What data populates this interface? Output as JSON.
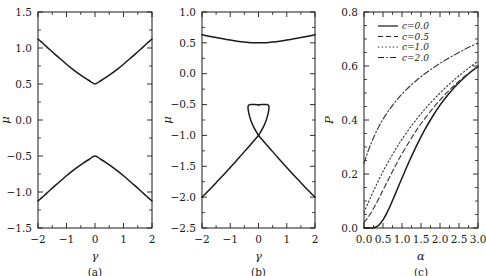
{
  "figure": {
    "width": 486,
    "height": 276,
    "background": "#ffffff",
    "line_color": "#1a1a1a"
  },
  "chart_data": [
    {
      "type": "line",
      "panel_label": "(a)",
      "title": "",
      "xlabel": "γ",
      "ylabel": "μ",
      "xlim": [
        -2,
        2
      ],
      "ylim": [
        -1.5,
        1.5
      ],
      "xticks": [
        -2,
        -1,
        0,
        1,
        2
      ],
      "xticklabels": [
        "−2",
        "−1",
        "0",
        "1",
        "2"
      ],
      "yticks": [
        -1.5,
        -1.0,
        -0.5,
        0.0,
        0.5,
        1.0,
        1.5
      ],
      "yticklabels": [
        "−1.5",
        "−1.0",
        "−0.5",
        "0.0",
        "0.5",
        "1.0",
        "1.5"
      ],
      "grid": false,
      "legend": "none",
      "series": [
        {
          "name": "upper-branch",
          "style": "solid",
          "x": [
            -2.0,
            -1.8,
            -1.6,
            -1.4,
            -1.2,
            -1.0,
            -0.8,
            -0.6,
            -0.4,
            -0.2,
            0.0,
            0.2,
            0.4,
            0.6,
            0.8,
            1.0,
            1.2,
            1.4,
            1.6,
            1.8,
            2.0
          ],
          "y": [
            1.125,
            1.055,
            0.983,
            0.912,
            0.843,
            0.775,
            0.71,
            0.65,
            0.595,
            0.545,
            0.5,
            0.545,
            0.595,
            0.65,
            0.71,
            0.775,
            0.843,
            0.912,
            0.983,
            1.055,
            1.125
          ]
        },
        {
          "name": "lower-branch",
          "style": "solid",
          "x": [
            -2.0,
            -1.8,
            -1.6,
            -1.4,
            -1.2,
            -1.0,
            -0.8,
            -0.6,
            -0.4,
            -0.2,
            0.0,
            0.2,
            0.4,
            0.6,
            0.8,
            1.0,
            1.2,
            1.4,
            1.6,
            1.8,
            2.0
          ],
          "y": [
            -1.125,
            -1.055,
            -0.983,
            -0.912,
            -0.843,
            -0.775,
            -0.71,
            -0.65,
            -0.595,
            -0.545,
            -0.5,
            -0.545,
            -0.595,
            -0.65,
            -0.71,
            -0.775,
            -0.843,
            -0.912,
            -0.983,
            -1.055,
            -1.125
          ]
        }
      ]
    },
    {
      "type": "line",
      "panel_label": "(b)",
      "title": "",
      "xlabel": "γ",
      "ylabel": "μ",
      "xlim": [
        -2,
        2
      ],
      "ylim": [
        -2.5,
        1.0
      ],
      "xticks": [
        -2,
        -1,
        0,
        1,
        2
      ],
      "xticklabels": [
        "−2",
        "−1",
        "0",
        "1",
        "2"
      ],
      "yticks": [
        -2.5,
        -2.0,
        -1.5,
        -1.0,
        -0.5,
        0.0,
        0.5,
        1.0
      ],
      "yticklabels": [
        "−2.5",
        "−2.0",
        "−1.5",
        "−1.0",
        "−0.5",
        "0.0",
        "0.5",
        "1.0"
      ],
      "grid": false,
      "legend": "none",
      "series": [
        {
          "name": "upper-branch",
          "style": "solid",
          "x": [
            -2.0,
            -1.75,
            -1.5,
            -1.25,
            -1.0,
            -0.75,
            -0.5,
            -0.25,
            0.0,
            0.25,
            0.5,
            0.75,
            1.0,
            1.25,
            1.5,
            1.75,
            2.0
          ],
          "y": [
            0.63,
            0.607,
            0.585,
            0.565,
            0.545,
            0.527,
            0.513,
            0.503,
            0.5,
            0.503,
            0.513,
            0.527,
            0.545,
            0.565,
            0.585,
            0.607,
            0.63
          ]
        },
        {
          "name": "loop-upper-left",
          "style": "solid",
          "x": [
            0.0,
            -0.08,
            -0.16,
            -0.24,
            -0.3,
            -0.345,
            -0.368,
            -0.37,
            -0.35,
            -0.3,
            -0.22,
            -0.12,
            0.0
          ],
          "y": [
            -1.0,
            -0.94,
            -0.875,
            -0.795,
            -0.715,
            -0.635,
            -0.57,
            -0.535,
            -0.512,
            -0.5,
            -0.498,
            -0.5,
            -0.505
          ]
        },
        {
          "name": "loop-upper-right",
          "style": "solid",
          "x": [
            0.0,
            0.08,
            0.16,
            0.24,
            0.3,
            0.345,
            0.368,
            0.37,
            0.35,
            0.3,
            0.22,
            0.12,
            0.0
          ],
          "y": [
            -1.0,
            -0.94,
            -0.875,
            -0.795,
            -0.715,
            -0.635,
            -0.57,
            -0.535,
            -0.512,
            -0.5,
            -0.498,
            -0.5,
            -0.505
          ]
        },
        {
          "name": "lower-arm-left",
          "style": "solid",
          "x": [
            0.0,
            -0.2,
            -0.4,
            -0.6,
            -0.8,
            -1.0,
            -1.2,
            -1.4,
            -1.6,
            -1.8,
            -2.0
          ],
          "y": [
            -1.0,
            -1.105,
            -1.21,
            -1.315,
            -1.42,
            -1.52,
            -1.62,
            -1.715,
            -1.815,
            -1.91,
            -2.0
          ]
        },
        {
          "name": "lower-arm-right",
          "style": "solid",
          "x": [
            0.0,
            0.2,
            0.4,
            0.6,
            0.8,
            1.0,
            1.2,
            1.4,
            1.6,
            1.8,
            2.0
          ],
          "y": [
            -1.0,
            -1.105,
            -1.21,
            -1.315,
            -1.42,
            -1.52,
            -1.62,
            -1.715,
            -1.815,
            -1.91,
            -2.0
          ]
        }
      ]
    },
    {
      "type": "line",
      "panel_label": "(c)",
      "title": "",
      "xlabel": "α",
      "ylabel": "P",
      "xlim": [
        0.0,
        3.0
      ],
      "ylim": [
        0.0,
        0.8
      ],
      "xticks": [
        0.0,
        0.5,
        1.0,
        1.5,
        2.0,
        2.5,
        3.0
      ],
      "xticklabels": [
        "0.0",
        "0.5",
        "1.0",
        "1.5",
        "2.0",
        "2.5",
        "3.0"
      ],
      "yticks": [
        0.0,
        0.2,
        0.4,
        0.6,
        0.8
      ],
      "yticklabels": [
        "0.0",
        "0.2",
        "0.4",
        "0.6",
        "0.8"
      ],
      "grid": false,
      "legend": "upper-left",
      "legend_entries": [
        "c=0.0",
        "c=0.5",
        "c=1.0",
        "c=2.0"
      ],
      "series": [
        {
          "name": "c=0.0",
          "label": "c=0.0",
          "style": "solid",
          "x": [
            0.0,
            0.1,
            0.2,
            0.3,
            0.4,
            0.5,
            0.6,
            0.7,
            0.8,
            0.9,
            1.0,
            1.2,
            1.4,
            1.6,
            1.8,
            2.0,
            2.2,
            2.4,
            2.6,
            2.8,
            3.0
          ],
          "y": [
            0.0,
            0.0,
            0.0,
            0.003,
            0.012,
            0.03,
            0.055,
            0.085,
            0.118,
            0.152,
            0.185,
            0.25,
            0.31,
            0.364,
            0.412,
            0.455,
            0.492,
            0.524,
            0.552,
            0.577,
            0.598
          ]
        },
        {
          "name": "c=0.5",
          "label": "c=0.5",
          "style": "dashed",
          "x": [
            0.0,
            0.1,
            0.2,
            0.3,
            0.4,
            0.5,
            0.6,
            0.7,
            0.8,
            0.9,
            1.0,
            1.2,
            1.4,
            1.6,
            1.8,
            2.0,
            2.2,
            2.4,
            2.6,
            2.8,
            3.0
          ],
          "y": [
            0.02,
            0.038,
            0.06,
            0.085,
            0.112,
            0.14,
            0.168,
            0.196,
            0.223,
            0.25,
            0.275,
            0.322,
            0.366,
            0.405,
            0.441,
            0.474,
            0.504,
            0.531,
            0.556,
            0.578,
            0.598
          ]
        },
        {
          "name": "c=1.0",
          "label": "c=1.0",
          "style": "dotted",
          "x": [
            0.0,
            0.1,
            0.2,
            0.3,
            0.4,
            0.5,
            0.6,
            0.7,
            0.8,
            0.9,
            1.0,
            1.2,
            1.4,
            1.6,
            1.8,
            2.0,
            2.2,
            2.4,
            2.6,
            2.8,
            3.0
          ],
          "y": [
            0.058,
            0.09,
            0.122,
            0.152,
            0.181,
            0.209,
            0.235,
            0.26,
            0.284,
            0.307,
            0.329,
            0.369,
            0.406,
            0.44,
            0.471,
            0.5,
            0.527,
            0.552,
            0.575,
            0.597,
            0.618
          ]
        },
        {
          "name": "c=2.0",
          "label": "c=2.0",
          "style": "dashdot",
          "x": [
            0.0,
            0.1,
            0.2,
            0.3,
            0.4,
            0.5,
            0.6,
            0.7,
            0.8,
            0.9,
            1.0,
            1.2,
            1.4,
            1.6,
            1.8,
            2.0,
            2.2,
            2.4,
            2.6,
            2.8,
            3.0
          ],
          "y": [
            0.24,
            0.282,
            0.318,
            0.35,
            0.378,
            0.403,
            0.425,
            0.445,
            0.463,
            0.48,
            0.496,
            0.524,
            0.549,
            0.571,
            0.591,
            0.61,
            0.627,
            0.643,
            0.658,
            0.672,
            0.685
          ]
        }
      ]
    }
  ]
}
